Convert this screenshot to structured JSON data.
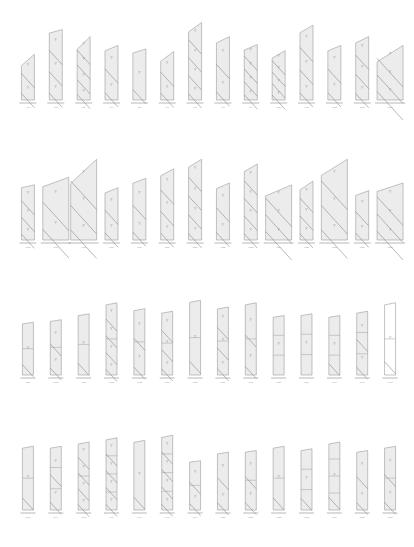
{
  "rows": [
    {
      "units": [
        {
          "tag": "W1",
          "h": 0.52,
          "slope": 0.25,
          "diagonals": 2,
          "splits": 0
        },
        {
          "tag": "W2",
          "h": 0.8,
          "slope": 0.05,
          "diagonals": 3,
          "splits": 0
        },
        {
          "tag": "W3",
          "h": 0.72,
          "slope": 0.2,
          "diagonals": 4,
          "splits": 0
        },
        {
          "tag": "W4",
          "h": 0.62,
          "slope": 0.1,
          "diagonals": 2,
          "splits": 0
        },
        {
          "tag": "W5",
          "h": 0.58,
          "slope": 0.08,
          "diagonals": 1,
          "splits": 0
        },
        {
          "tag": "W6",
          "h": 0.55,
          "slope": 0.2,
          "diagonals": 2,
          "splits": 0
        },
        {
          "tag": "W7",
          "h": 0.88,
          "slope": 0.12,
          "diagonals": 4,
          "splits": 0
        },
        {
          "tag": "W8",
          "h": 0.72,
          "slope": 0.1,
          "diagonals": 2,
          "splits": 0
        },
        {
          "tag": "W9",
          "h": 0.63,
          "slope": 0.1,
          "diagonals": 4,
          "splits": 0
        },
        {
          "tag": "W10",
          "h": 0.56,
          "slope": 0.15,
          "diagonals": 4,
          "splits": 0
        },
        {
          "tag": "W11",
          "h": 0.85,
          "slope": 0.1,
          "diagonals": 3,
          "splits": 0
        },
        {
          "tag": "W12",
          "h": 0.62,
          "slope": 0.1,
          "diagonals": 2,
          "splits": 0
        },
        {
          "tag": "W13",
          "h": 0.72,
          "slope": 0.1,
          "diagonals": 3,
          "splits": 0
        },
        {
          "tag": "W14",
          "h": 0.62,
          "slope": 0.3,
          "diagonals": 3,
          "splits": 0,
          "wide": true
        }
      ]
    },
    {
      "units": [
        {
          "tag": "W15",
          "h": 0.58,
          "slope": 0.05,
          "diagonals": 3,
          "splits": 0
        },
        {
          "tag": "W16",
          "h": 0.66,
          "slope": 0.15,
          "diagonals": 2,
          "splits": 0,
          "wide": true
        },
        {
          "tag": "W17",
          "h": 0.85,
          "slope": 0.3,
          "diagonals": 3,
          "splits": 0,
          "wide": true
        },
        {
          "tag": "W18",
          "h": 0.55,
          "slope": 0.1,
          "diagonals": 2,
          "splits": 0
        },
        {
          "tag": "W19",
          "h": 0.65,
          "slope": 0.08,
          "diagonals": 2,
          "splits": 0
        },
        {
          "tag": "W20",
          "h": 0.75,
          "slope": 0.1,
          "diagonals": 3,
          "splits": 0
        },
        {
          "tag": "W21",
          "h": 0.85,
          "slope": 0.1,
          "diagonals": 4,
          "splits": 0
        },
        {
          "tag": "W22",
          "h": 0.6,
          "slope": 0.1,
          "diagonals": 2,
          "splits": 0
        },
        {
          "tag": "W23",
          "h": 0.8,
          "slope": 0.1,
          "diagonals": 4,
          "splits": 0
        },
        {
          "tag": "W24",
          "h": 0.58,
          "slope": 0.2,
          "diagonals": 3,
          "splits": 0,
          "wide": true
        },
        {
          "tag": "W25",
          "h": 0.62,
          "slope": 0.15,
          "diagonals": 3,
          "splits": 0
        },
        {
          "tag": "W26",
          "h": 0.85,
          "slope": 0.2,
          "diagonals": 3,
          "splits": 0,
          "wide": true
        },
        {
          "tag": "W27",
          "h": 0.52,
          "slope": 0.1,
          "diagonals": 2,
          "splits": 0
        },
        {
          "tag": "W28",
          "h": 0.6,
          "slope": 0.15,
          "diagonals": 3,
          "splits": 0,
          "wide": true
        }
      ]
    },
    {
      "units": [
        {
          "tag": "W29",
          "h": 0.62,
          "slope": 0.03,
          "diagonals": 1,
          "splits": 1
        },
        {
          "tag": "W30",
          "h": 0.65,
          "slope": 0.03,
          "diagonals": 2,
          "splits": 1
        },
        {
          "tag": "W31",
          "h": 0.72,
          "slope": 0.03,
          "diagonals": 1,
          "splits": 1
        },
        {
          "tag": "W32",
          "h": 0.85,
          "slope": 0.03,
          "diagonals": 4,
          "splits": 1
        },
        {
          "tag": "W33",
          "h": 0.78,
          "slope": 0.03,
          "diagonals": 2,
          "splits": 1
        },
        {
          "tag": "W34",
          "h": 0.75,
          "slope": 0.03,
          "diagonals": 3,
          "splits": 1
        },
        {
          "tag": "W35",
          "h": 0.88,
          "slope": 0.03,
          "diagonals": 1,
          "splits": 1
        },
        {
          "tag": "W36",
          "h": 0.8,
          "slope": 0.03,
          "diagonals": 3,
          "splits": 1
        },
        {
          "tag": "W37",
          "h": 0.85,
          "slope": 0.03,
          "diagonals": 2,
          "splits": 1
        },
        {
          "tag": "W38",
          "h": 0.7,
          "slope": 0.03,
          "diagonals": 0,
          "splits": 2
        },
        {
          "tag": "W39",
          "h": 0.72,
          "slope": 0.03,
          "diagonals": 0,
          "splits": 2
        },
        {
          "tag": "W40",
          "h": 0.7,
          "slope": 0.03,
          "diagonals": 1,
          "splits": 2
        },
        {
          "tag": "W41",
          "h": 0.75,
          "slope": 0.03,
          "diagonals": 2,
          "splits": 2
        },
        {
          "tag": "W42",
          "h": 0.85,
          "slope": 0.03,
          "diagonals": 1,
          "splits": 1,
          "empty": true
        }
      ]
    },
    {
      "units": [
        {
          "tag": "W43",
          "h": 0.75,
          "slope": 0.03,
          "diagonals": 1,
          "splits": 1
        },
        {
          "tag": "W44",
          "h": 0.75,
          "slope": 0.03,
          "diagonals": 2,
          "splits": 2
        },
        {
          "tag": "W45",
          "h": 0.8,
          "slope": 0.03,
          "diagonals": 4,
          "splits": 1
        },
        {
          "tag": "W46",
          "h": 0.85,
          "slope": 0.03,
          "diagonals": 4,
          "splits": 3
        },
        {
          "tag": "W47",
          "h": 0.82,
          "slope": 0.03,
          "diagonals": 1,
          "splits": 0
        },
        {
          "tag": "W48",
          "h": 0.88,
          "slope": 0.03,
          "diagonals": 4,
          "splits": 3
        },
        {
          "tag": "W49",
          "h": 0.58,
          "slope": 0.03,
          "diagonals": 2,
          "splits": 1
        },
        {
          "tag": "W50",
          "h": 0.68,
          "slope": 0.03,
          "diagonals": 2,
          "splits": 0
        },
        {
          "tag": "W51",
          "h": 0.7,
          "slope": 0.03,
          "diagonals": 2,
          "splits": 1
        },
        {
          "tag": "W52",
          "h": 0.75,
          "slope": 0.03,
          "diagonals": 1,
          "splits": 1
        },
        {
          "tag": "W53",
          "h": 0.72,
          "slope": 0.03,
          "diagonals": 1,
          "splits": 2
        },
        {
          "tag": "W54",
          "h": 0.8,
          "slope": 0.03,
          "diagonals": 1,
          "splits": 3
        },
        {
          "tag": "W55",
          "h": 0.7,
          "slope": 0.03,
          "diagonals": 2,
          "splits": 0
        },
        {
          "tag": "W56",
          "h": 0.75,
          "slope": 0.03,
          "diagonals": 2,
          "splits": 1
        }
      ]
    }
  ]
}
